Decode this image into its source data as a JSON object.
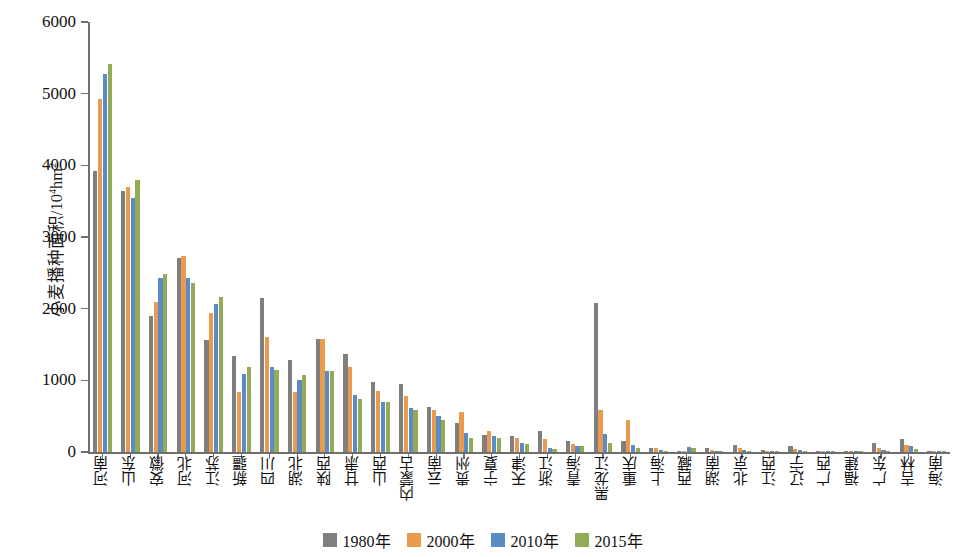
{
  "chart_data": {
    "type": "bar",
    "title": "",
    "xlabel": "",
    "ylabel": "小麦播种面积/10⁴hm²",
    "ylim": [
      0,
      6000
    ],
    "yticks": [
      0,
      1000,
      2000,
      3000,
      4000,
      5000,
      6000
    ],
    "ytick_labels": [
      "0",
      "1000",
      "2000",
      "3000",
      "4000",
      "5000",
      "6000"
    ],
    "grid": false,
    "legend_position": "bottom-center",
    "categories": [
      "河南",
      "山东",
      "安徽",
      "河北",
      "江苏",
      "新疆",
      "四川",
      "湖北",
      "陕西",
      "甘肃",
      "山西",
      "内蒙古",
      "云南",
      "贵州",
      "宁夏",
      "天津",
      "浙江",
      "青海",
      "黑龙江",
      "重庆",
      "上海",
      "西藏",
      "湖南",
      "北京",
      "江西",
      "辽宁",
      "广西",
      "福建",
      "广东",
      "吉林",
      "海南"
    ],
    "series": [
      {
        "name": "1980年",
        "color": "#7f7f7f",
        "values": [
          3920,
          3640,
          1900,
          2710,
          1560,
          1340,
          2150,
          1280,
          1570,
          1370,
          970,
          950,
          630,
          400,
          240,
          230,
          290,
          160,
          2080,
          155,
          60,
          10,
          60,
          95,
          30,
          80,
          8,
          3,
          120,
          185,
          12
        ]
      },
      {
        "name": "2000年",
        "color": "#e89a4e",
        "values": [
          4920,
          3700,
          2100,
          2740,
          1940,
          840,
          1610,
          840,
          1580,
          1180,
          850,
          780,
          590,
          560,
          300,
          200,
          180,
          110,
          590,
          440,
          50,
          20,
          35,
          60,
          15,
          40,
          5,
          2,
          60,
          100,
          7
        ]
      },
      {
        "name": "2010年",
        "color": "#5b8bc4",
        "values": [
          5270,
          3540,
          2430,
          2430,
          2060,
          1090,
          1190,
          1000,
          1130,
          790,
          700,
          620,
          500,
          260,
          220,
          125,
          55,
          80,
          250,
          95,
          30,
          75,
          20,
          30,
          8,
          25,
          3,
          1,
          35,
          80,
          4
        ]
      },
      {
        "name": "2015年",
        "color": "#93ab57",
        "values": [
          5420,
          3790,
          2480,
          2360,
          2160,
          1180,
          1150,
          1070,
          1130,
          740,
          700,
          580,
          440,
          190,
          190,
          110,
          40,
          90,
          130,
          60,
          20,
          60,
          12,
          20,
          5,
          15,
          2,
          1,
          20,
          40,
          2
        ]
      }
    ]
  },
  "legend": {
    "items": [
      {
        "label": "1980年",
        "color": "#7f7f7f"
      },
      {
        "label": "2000年",
        "color": "#e89a4e"
      },
      {
        "label": "2010年",
        "color": "#5b8bc4"
      },
      {
        "label": "2015年",
        "color": "#93ab57"
      }
    ]
  },
  "axis": {
    "y_title_main": "小麦播种面积/10",
    "y_title_sup": "4",
    "y_title_tail": "hm",
    "y_title_sup2": "2"
  }
}
